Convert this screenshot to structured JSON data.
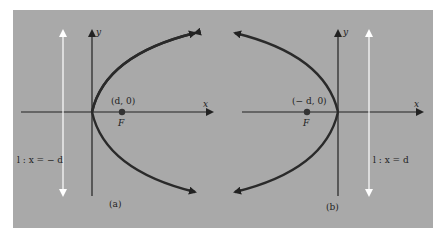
{
  "figure": {
    "background_color": "#a9a9a9",
    "curve_color": "#2a2a2a",
    "directrix_color": "#ffffff",
    "panels": [
      {
        "id": "a",
        "caption": "(a)",
        "axis_x_label": "x",
        "axis_y_label": "y",
        "focus_coord_label": "(d, 0)",
        "focus_label": "F",
        "directrix_label": "l : x = − d",
        "opens": "right"
      },
      {
        "id": "b",
        "caption": "(b)",
        "axis_x_label": "x",
        "axis_y_label": "y",
        "focus_coord_label": "(− d, 0)",
        "focus_label": "F",
        "directrix_label": "l : x = d",
        "opens": "left"
      }
    ]
  }
}
